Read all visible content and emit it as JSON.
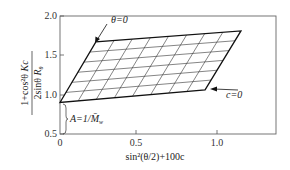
{
  "chart_data": {
    "type": "line",
    "title": "",
    "subtitle": "Zimm plot",
    "xlabel": "sin²(θ/2)+100c",
    "ylabel": "(1+cos²θ Kc) / (2sinθ R_θ)",
    "xlim": [
      0,
      1.25
    ],
    "ylim": [
      0.5,
      2.0
    ],
    "x_ticks": [
      {
        "value": 0,
        "label": "0"
      },
      {
        "value": 0.5,
        "label": "0.5"
      },
      {
        "value": 1.0,
        "label": "1.0"
      }
    ],
    "y_ticks": [
      {
        "value": 0.5,
        "label": "0.5"
      },
      {
        "value": 1.0,
        "label": "1.0"
      },
      {
        "value": 1.5,
        "label": "1.5"
      },
      {
        "value": 2.0,
        "label": "2.0"
      }
    ],
    "grid": false,
    "legend": null,
    "parallelogram": {
      "bottom_left": [
        0.0,
        0.9
      ],
      "top_left": [
        0.23,
        1.67
      ],
      "top_right": [
        1.16,
        1.81
      ],
      "bottom_right": [
        0.93,
        1.06
      ]
    },
    "grid_rows": 6,
    "grid_cols": 8,
    "series": [
      {
        "name": "θ=0 extrapolation",
        "x": [
          0.0,
          0.23
        ],
        "y": [
          0.9,
          1.67
        ]
      },
      {
        "name": "c=0 extrapolation",
        "x": [
          0.0,
          0.93
        ],
        "y": [
          0.9,
          1.06
        ]
      }
    ],
    "annotations": [
      {
        "text": "θ=0",
        "x": 0.3,
        "y": 1.88,
        "arrow_to": [
          0.23,
          1.68
        ]
      },
      {
        "text": "c=0",
        "x": 1.1,
        "y": 1.02,
        "arrow_to": [
          0.95,
          1.06
        ]
      },
      {
        "text": "A=1/M̄w",
        "x": 0.05,
        "y": 0.72,
        "brace_from": 0.5,
        "brace_to": 0.9
      }
    ]
  },
  "labels": {
    "y_axis": {
      "num_part1": "1+cos²θ",
      "num_part2": "Kc",
      "den_part1": "2sinθ",
      "den_part2": "R",
      "den_sub": "θ"
    },
    "x_axis": "sin²(θ/2)+100c",
    "theta_zero": "θ=0",
    "c_zero": "c=0",
    "intercept": "A=1/M̄",
    "intercept_sub": "w",
    "x_tick_0": "0",
    "x_tick_05": "0.5",
    "x_tick_10": "1.0",
    "y_tick_05": "0.5",
    "y_tick_10": "1.0",
    "y_tick_15": "1.5",
    "y_tick_20": "2.0"
  }
}
